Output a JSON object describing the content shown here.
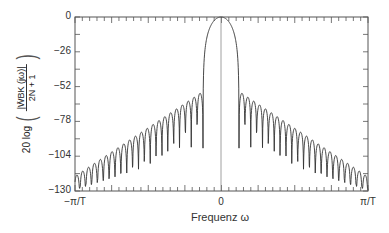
{
  "chart_data": {
    "type": "line",
    "title": "",
    "xlabel": "Frequenz ω",
    "ylabel": "20 log ( |W̄BK(jω)| / (2N + 1) )",
    "ylabel_parts": {
      "prefix": "20 log",
      "numerator": "|W̄BK (jω)|",
      "denominator": "2N + 1"
    },
    "x_ticks": [
      "−π/T",
      "0",
      "π/T"
    ],
    "y_ticks": [
      0,
      -26,
      -52,
      -78,
      -104,
      -130
    ],
    "ylim": [
      -130,
      0
    ],
    "xlim": [
      "-π/T",
      "π/T"
    ],
    "grid": false,
    "legend": null,
    "series": [
      {
        "name": "Bartlett-Kaiser window spectrum (normalized)",
        "main_lobe": {
          "peak_db": 0,
          "half_width_fraction": 0.12
        },
        "sidelobes_per_side": 22,
        "first_sidelobe_peak_db": -57,
        "edge_sidelobe_peak_db": -118,
        "null_floor_db": -130
      }
    ]
  },
  "colors": {
    "curve": "#333333",
    "axis": "#555555",
    "background": "#ffffff"
  }
}
